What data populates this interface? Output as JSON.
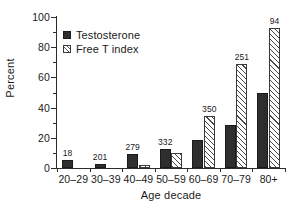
{
  "chart_data": {
    "type": "bar",
    "title": "",
    "xlabel": "Age decade",
    "ylabel": "Percent",
    "categories": [
      "20–29",
      "30–39",
      "40–49",
      "50–59",
      "60–69",
      "70–79",
      "80+"
    ],
    "series": [
      {
        "name": "Testosterone",
        "fill": "solid",
        "color": "#2e2e2e",
        "values": [
          5.2,
          2.5,
          9.0,
          12.5,
          18.8,
          28.6,
          49.5
        ]
      },
      {
        "name": "Free T index",
        "fill": "hatched",
        "color": "#ffffff",
        "values": [
          0,
          0,
          2.0,
          10.0,
          34.5,
          69.0,
          92.5
        ]
      }
    ],
    "point_labels": [
      "18",
      "201",
      "279",
      "332",
      "350",
      "251",
      "94"
    ],
    "point_labels_meaning": "n per age decade",
    "ylim": [
      0,
      100
    ],
    "yticks": [
      0,
      20,
      40,
      60,
      80,
      100
    ],
    "ytick_labels": [
      "0",
      "20",
      "40",
      "60",
      "80",
      "100"
    ],
    "yticks_minor": [
      10,
      30,
      50,
      70,
      90
    ],
    "grid": false,
    "legend_position": "upper-left-inside"
  },
  "legend": {
    "items": [
      {
        "label": "Testosterone",
        "swatch": "solid-square-icon"
      },
      {
        "label": "Free T index",
        "swatch": "hatched-square-icon"
      }
    ]
  },
  "axes": {
    "y_title": "Percent",
    "x_title": "Age decade"
  }
}
